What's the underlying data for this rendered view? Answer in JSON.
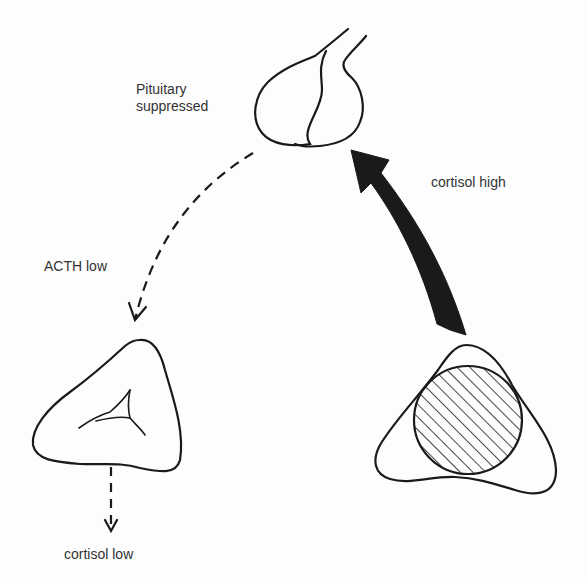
{
  "diagram": {
    "type": "endocrine feedback diagram",
    "labels": {
      "pituitary_line1": "Pituitary",
      "pituitary_line2": "suppressed",
      "acth": "ACTH low",
      "cortisol_high": "cortisol high",
      "cortisol_low": "cortisol low"
    },
    "nodes": [
      {
        "id": "pituitary",
        "name": "Pituitary gland",
        "state": "suppressed"
      },
      {
        "id": "left-adrenal",
        "name": "Atrophic adrenal gland",
        "state": "cortisol low"
      },
      {
        "id": "right-adrenal",
        "name": "Adrenal with tumour (hatched)",
        "state": "cortisol high"
      }
    ],
    "edges": [
      {
        "from": "pituitary",
        "to": "left-adrenal",
        "style": "dashed",
        "label": "ACTH low"
      },
      {
        "from": "right-adrenal",
        "to": "pituitary",
        "style": "thick solid",
        "label": "cortisol high"
      },
      {
        "from": "left-adrenal",
        "to": "output",
        "style": "dashed",
        "label": "cortisol low"
      }
    ],
    "colors": {
      "stroke": "#1a1a1a",
      "text": "#333333",
      "background": "#fdfdfd"
    }
  }
}
